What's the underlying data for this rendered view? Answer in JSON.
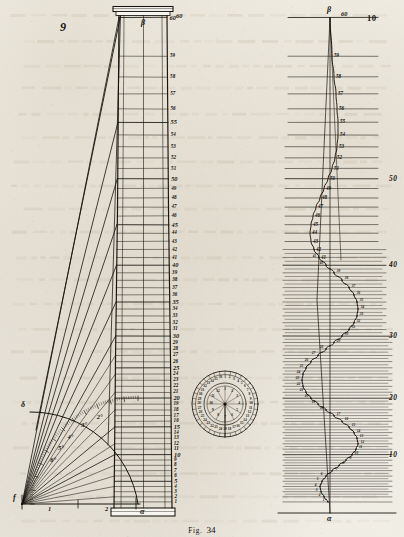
{
  "plate": {
    "caption_prefix": "Fig.",
    "caption_number": "34",
    "background_hex": "#efece4",
    "ink_hex": "#17140f"
  },
  "figure9": {
    "number_label": "9",
    "top_point_label": "β",
    "base_point_label": "α",
    "origin_label": "f",
    "arc_start_label": "δ",
    "baseline_ticks": [
      "1",
      "2"
    ],
    "arc_degree_labels": [
      "2°",
      "3°",
      "4°",
      "5°",
      "6°"
    ],
    "top_scale_label": "60",
    "scale_values": [
      60,
      59,
      58,
      57,
      56,
      55,
      54,
      53,
      52,
      51,
      50,
      49,
      48,
      47,
      46,
      45,
      44,
      43,
      42,
      41,
      40,
      39,
      38,
      37,
      36,
      35,
      34,
      33,
      32,
      31,
      30,
      29,
      28,
      27,
      26,
      25,
      24,
      23,
      22,
      21,
      20,
      19,
      18,
      17,
      16,
      15,
      14,
      13,
      12,
      11,
      10,
      9,
      8,
      7,
      6,
      5,
      4,
      3,
      2,
      1
    ],
    "emphasized_values": [
      60,
      55,
      50,
      45,
      40,
      35,
      30,
      25,
      20,
      15,
      10,
      5
    ]
  },
  "figure10": {
    "number_label": "10",
    "top_point_label": "β",
    "base_point_label": "α",
    "top_scale_label": "60",
    "upper_scale_labels": [
      "59",
      "58",
      "57",
      "56",
      "55",
      "54",
      "53",
      "52",
      "51",
      "50",
      "49",
      "48",
      "47",
      "46",
      "45",
      "44",
      "43",
      "42",
      "41"
    ],
    "decade_labels": [
      "50",
      "40",
      "30",
      "20",
      "10"
    ],
    "curve_point_labels": [
      "41",
      "40",
      "39",
      "38",
      "37",
      "36",
      "35",
      "34",
      "33",
      "32",
      "31",
      "30",
      "29",
      "28",
      "27",
      "26",
      "25",
      "24",
      "23",
      "22",
      "21",
      "20",
      "19",
      "18",
      "17",
      "16",
      "15",
      "14",
      "13",
      "12",
      "11",
      "10",
      "9",
      "8",
      "7",
      "6",
      "5",
      "4",
      "3",
      "2",
      "1"
    ]
  },
  "dial": {
    "outer_ring_numbers": [
      "1",
      "2",
      "3",
      "4",
      "5",
      "6",
      "7",
      "8",
      "9",
      "10",
      "11",
      "12",
      "13",
      "14",
      "15",
      "16",
      "17",
      "18",
      "19",
      "20",
      "21",
      "22",
      "23",
      "24",
      "25",
      "26",
      "27",
      "28",
      "29",
      "30",
      "31",
      "32",
      "33",
      "34",
      "35",
      "36"
    ],
    "inner_ring_numbers": [
      "1",
      "2",
      "3",
      "4",
      "5",
      "6",
      "7",
      "8",
      "9",
      "10",
      "11",
      "12"
    ],
    "center_label": "",
    "pointer_name": "dial-pointer"
  },
  "chart_data": {
    "type": "line",
    "xlabel": "",
    "ylabel": "scale divisions",
    "ylim": [
      0,
      60
    ],
    "grid": true,
    "legend": "none",
    "series": [
      {
        "name": "figure-9-taper-profile",
        "comment": "left edge of column, slight entasis taper from base to capital",
        "y": [
          60,
          55,
          50,
          45,
          40,
          35,
          30,
          25,
          20,
          15,
          10,
          5,
          1
        ],
        "x": [
          0.0,
          0.05,
          0.1,
          0.16,
          0.22,
          0.28,
          0.35,
          0.42,
          0.5,
          0.58,
          0.66,
          0.74,
          0.8
        ]
      },
      {
        "name": "figure-10-deflection-curve",
        "comment": "serpentine S-curve, horizontal deflection vs scale height",
        "y": [
          60,
          59,
          58,
          57,
          56,
          55,
          54,
          53,
          52,
          51,
          50,
          49,
          48,
          47,
          46,
          45,
          44,
          43,
          42,
          41,
          40,
          39,
          38,
          37,
          36,
          35,
          34,
          33,
          32,
          31,
          30,
          29,
          28,
          27,
          26,
          25,
          24,
          23,
          22,
          21,
          20,
          19,
          18,
          17,
          16,
          15,
          14,
          13,
          12,
          11,
          10,
          9,
          8,
          7,
          6,
          5,
          4,
          3,
          2,
          1
        ],
        "x": [
          0,
          2,
          4,
          6,
          7,
          8,
          8,
          7,
          5,
          2,
          -2,
          -6,
          -10,
          -14,
          -17,
          -19,
          -20,
          -19,
          -16,
          -11,
          -4,
          4,
          12,
          19,
          24,
          27,
          28,
          27,
          24,
          19,
          12,
          4,
          -4,
          -12,
          -19,
          -24,
          -27,
          -28,
          -27,
          -24,
          -19,
          -12,
          -4,
          4,
          12,
          19,
          24,
          27,
          28,
          26,
          22,
          16,
          9,
          2,
          -4,
          -8,
          -10,
          -9,
          -6,
          -2
        ]
      }
    ],
    "annotations": [
      {
        "text": "β",
        "series": "both",
        "at": "top of vertical axis"
      },
      {
        "text": "α",
        "series": "both",
        "at": "base of vertical axis"
      },
      {
        "text": "f",
        "series": "figure-9",
        "at": "lower-left origin of arc"
      }
    ]
  }
}
